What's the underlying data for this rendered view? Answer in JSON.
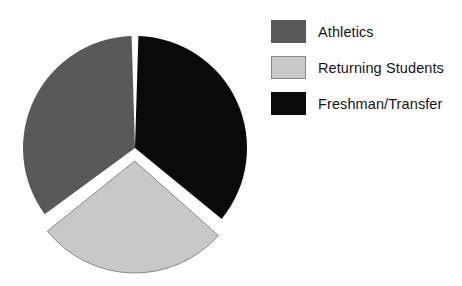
{
  "chart_data": {
    "type": "pie",
    "title": "",
    "subtitle": "",
    "xlabel": "",
    "ylabel": "",
    "grid": false,
    "legend_position": "right",
    "start_angle_deg": 0,
    "direction": "clockwise",
    "categories": [
      "Athletics",
      "Returning Students",
      "Freshman/Transfer"
    ],
    "values": [
      36,
      28,
      36
    ],
    "slices": [
      {
        "label": "Athletics",
        "value": 36,
        "percent": 36,
        "color": "#595959",
        "start_angle_deg": 232,
        "end_angle_deg": 360,
        "exploded": false
      },
      {
        "label": "Returning Students",
        "value": 28,
        "percent": 28,
        "color": "#c8c8c8",
        "border_color": "#8a8a8a",
        "start_angle_deg": 131,
        "end_angle_deg": 232,
        "exploded": true
      },
      {
        "label": "Freshman/Transfer",
        "value": 36,
        "percent": 36,
        "color": "#0a0a0a",
        "start_angle_deg": 0,
        "end_angle_deg": 131,
        "exploded": false
      }
    ],
    "geometry": {
      "center_x": 135,
      "center_y": 148,
      "radius": 112,
      "explode_offset_px": 13,
      "explode_direction_deg": 181,
      "gap_color": "#ffffff",
      "gap_width_px": 4
    }
  },
  "legend": {
    "items": [
      {
        "label": "Athletics",
        "color": "#595959"
      },
      {
        "label": "Returning Students",
        "color": "#c8c8c8"
      },
      {
        "label": "Freshman/Transfer",
        "color": "#0a0a0a"
      }
    ]
  },
  "colors": {
    "background": "#ffffff",
    "athletics": "#595959",
    "returning_students": "#c8c8c8",
    "freshman_transfer": "#0a0a0a",
    "text": "#131313"
  }
}
